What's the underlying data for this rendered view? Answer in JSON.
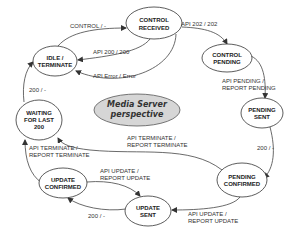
{
  "diagram": {
    "center_fill": "#d6d6d6",
    "nodes": [
      {
        "id": "control_received",
        "line1": "CONTROL",
        "line2": "RECEIVED"
      },
      {
        "id": "idle_terminate",
        "line1": "IDLE /",
        "line2": "TERMINATE"
      },
      {
        "id": "control_pending",
        "line1": "CONTROL",
        "line2": "PENDING"
      },
      {
        "id": "pending_sent",
        "line1": "PENDING",
        "line2": "SENT"
      },
      {
        "id": "waiting",
        "line1": "WAITING",
        "line2": "FOR LAST",
        "line3": "200"
      },
      {
        "id": "pending_confirmed",
        "line1": "PENDING",
        "line2": "CONFIRMED"
      },
      {
        "id": "update_confirmed",
        "line1": "UPDATE",
        "line2": "CONFIRMED"
      },
      {
        "id": "update_sent",
        "line1": "UPDATE",
        "line2": "SENT"
      }
    ],
    "edges": [
      {
        "from": "idle_terminate",
        "to": "control_received",
        "line1": "CONTROL / -"
      },
      {
        "from": "control_received",
        "to": "idle_terminate",
        "line1": "API 200 / 200"
      },
      {
        "from": "control_received",
        "to": "idle_terminate",
        "line1": "API Error / Error"
      },
      {
        "from": "control_received",
        "to": "control_pending",
        "line1": "API 202 / 202"
      },
      {
        "from": "control_pending",
        "to": "pending_sent",
        "line1": "API PENDING /",
        "line2": "REPORT PENDING"
      },
      {
        "from": "pending_sent",
        "to": "pending_confirmed",
        "line1": "200 / -"
      },
      {
        "from": "pending_confirmed",
        "to": "waiting",
        "line1": "API TERMINATE /",
        "line2": "REPORT TERMINATE"
      },
      {
        "from": "update_confirmed",
        "to": "waiting",
        "line1": "API TERMINATE /",
        "line2": "REPORT TERMINATE"
      },
      {
        "from": "waiting",
        "to": "idle_terminate",
        "line1": "200 / -"
      },
      {
        "from": "pending_confirmed",
        "to": "update_sent",
        "line1": "API UPDATE /",
        "line2": "REPORT UPDATE"
      },
      {
        "from": "update_confirmed",
        "to": "update_sent",
        "line1": "API UPDATE /",
        "line2": "REPORT UPDATE"
      },
      {
        "from": "update_sent",
        "to": "update_confirmed",
        "line1": "200 / -"
      }
    ]
  }
}
